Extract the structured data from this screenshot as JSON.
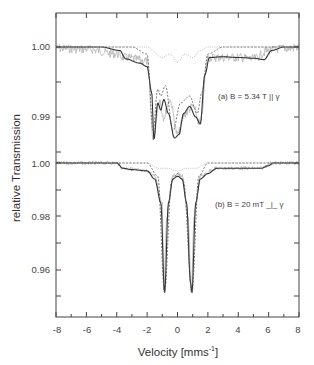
{
  "chart_data": {
    "type": "line",
    "title": "",
    "xlabel": "Velocity [mms^-1]",
    "ylabel": "relative  Transmission",
    "xlim": [
      -8,
      8
    ],
    "x_ticks": [
      -8,
      -6,
      -4,
      -2,
      0,
      2,
      4,
      6,
      8
    ],
    "grid": false,
    "legend": null,
    "panels": [
      {
        "id": "a",
        "annotation": "(a) B = 5.34 T || γ",
        "y_ticks": [
          1.0,
          0.99
        ],
        "ylim": [
          0.985,
          1.003
        ],
        "series": [
          {
            "name": "measured data",
            "style": "noisy light gray",
            "x": [
              -8,
              -6,
              -4,
              -3.5,
              -2,
              -1.6,
              -1.2,
              -0.9,
              -0.5,
              0,
              0.5,
              1,
              1.5,
              2,
              3,
              4,
              5,
              6,
              7,
              8
            ],
            "y": [
              0.9998,
              0.9997,
              0.999,
              0.9985,
              0.998,
              0.987,
              0.9925,
              0.99,
              0.9925,
              0.9875,
              0.9905,
              0.9915,
              0.989,
              0.9985,
              0.9985,
              0.9985,
              0.9983,
              0.9995,
              0.9998,
              0.9999
            ]
          },
          {
            "name": "total fit",
            "style": "solid dark",
            "x": [
              -8,
              -5,
              -3.8,
              -3.4,
              -2.5,
              -2,
              -1.7,
              -1.55,
              -1.3,
              -1.1,
              -0.9,
              -0.6,
              -0.2,
              0.1,
              0.4,
              0.8,
              1.2,
              1.5,
              1.8,
              2.1,
              3,
              4,
              5,
              5.7,
              6.2,
              7,
              8
            ],
            "y": [
              1.0,
              1.0,
              0.9995,
              0.9983,
              0.9977,
              0.9972,
              0.9935,
              0.9868,
              0.992,
              0.991,
              0.9925,
              0.9905,
              0.987,
              0.9875,
              0.9905,
              0.9915,
              0.99,
              0.989,
              0.996,
              0.9985,
              0.9986,
              0.9985,
              0.9984,
              0.9982,
              0.9995,
              1.0,
              1.0
            ]
          },
          {
            "name": "subspectrum 1",
            "style": "dashed",
            "x": [
              -8,
              -3,
              -2,
              -1.6,
              -1.3,
              -1.1,
              -0.8,
              -0.3,
              0.2,
              0.8,
              1.3,
              1.6,
              2,
              3,
              8
            ],
            "y": [
              1.0,
              1.0,
              0.999,
              0.988,
              0.994,
              0.993,
              0.9945,
              0.988,
              0.992,
              0.993,
              0.9905,
              0.9935,
              0.999,
              1.0,
              1.0
            ]
          },
          {
            "name": "subspectrum 2",
            "style": "dotted light",
            "x": [
              -8,
              -2,
              -1,
              -0.5,
              0,
              0.5,
              1,
              1.5,
              2,
              8
            ],
            "y": [
              1.0,
              1.0,
              0.9985,
              0.999,
              0.9978,
              0.999,
              0.9985,
              0.9995,
              1.0,
              1.0
            ]
          }
        ]
      },
      {
        "id": "b",
        "annotation": "(b) B = 20  mT _|_ γ",
        "y_ticks": [
          1.0,
          0.98,
          0.96
        ],
        "ylim": [
          0.948,
          1.003
        ],
        "series": [
          {
            "name": "measured data",
            "style": "noisy light gray",
            "x": [
              -8,
              -4,
              -3.6,
              -2,
              -1.5,
              -1,
              -0.9,
              -0.7,
              -0.3,
              0,
              0.3,
              0.7,
              0.9,
              1.1,
              1.5,
              2.5,
              4,
              5.5,
              6.2,
              8
            ],
            "y": [
              1.0,
              1.0,
              0.998,
              0.997,
              0.995,
              0.985,
              0.952,
              0.98,
              0.995,
              0.996,
              0.995,
              0.98,
              0.95,
              0.98,
              0.995,
              0.998,
              0.998,
              0.998,
              1.0,
              1.0
            ]
          },
          {
            "name": "total fit",
            "style": "solid dark",
            "x": [
              -8,
              -4,
              -3.6,
              -3,
              -2,
              -1.5,
              -1.1,
              -0.85,
              -0.6,
              -0.3,
              0,
              0.3,
              0.6,
              0.85,
              0.95,
              1.2,
              1.5,
              2,
              2.6,
              4,
              5.5,
              6,
              6.3,
              8
            ],
            "y": [
              1.0,
              1.0,
              0.998,
              0.9975,
              0.997,
              0.994,
              0.985,
              0.951,
              0.985,
              0.994,
              0.995,
              0.994,
              0.985,
              0.955,
              0.951,
              0.985,
              0.994,
              0.996,
              0.998,
              0.998,
              0.998,
              0.999,
              1.0,
              1.0
            ]
          },
          {
            "name": "subspectrum 1",
            "style": "dashed",
            "x": [
              -8,
              -2,
              -1.3,
              -0.85,
              -0.4,
              0,
              0.4,
              0.95,
              1.4,
              2,
              8
            ],
            "y": [
              1.0,
              1.0,
              0.995,
              0.951,
              0.993,
              0.996,
              0.993,
              0.951,
              0.995,
              1.0,
              1.0
            ]
          },
          {
            "name": "subspectrum 2",
            "style": "dotted light",
            "x": [
              -8,
              -2,
              -1.2,
              -0.6,
              0,
              0.6,
              1.2,
              2,
              8
            ],
            "y": [
              1.0,
              1.0,
              0.998,
              0.998,
              0.997,
              0.998,
              0.998,
              1.0,
              1.0
            ]
          }
        ]
      }
    ]
  },
  "labels": {
    "ylabel": "relative  Transmission",
    "xlabel_main": "Velocity [mms",
    "xlabel_sup": "-1",
    "xlabel_end": "]",
    "annot_a": "(a) B = 5.34 T || γ",
    "annot_b": "(b) B = 20  mT _|_ γ",
    "x_ticks": [
      "-8",
      "-6",
      "-4",
      "-2",
      "0",
      "2",
      "4",
      "6",
      "8"
    ],
    "y_ticks_a": [
      "1.00",
      "0.99"
    ],
    "y_ticks_b": [
      "1.00",
      "0.98",
      "0.96"
    ]
  }
}
